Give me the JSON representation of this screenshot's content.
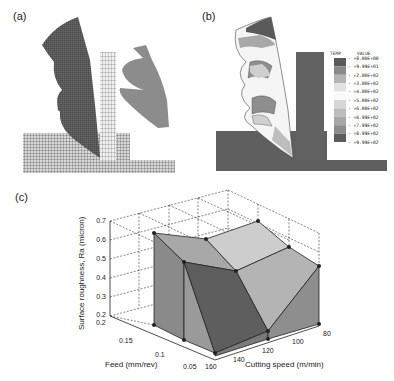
{
  "panels": {
    "a": {
      "label": "(a)"
    },
    "b": {
      "label": "(b)",
      "legend": {
        "header_left": "TEMP",
        "header_right": "VALUE",
        "entries": [
          {
            "value": "+8.00E+00",
            "color": "#5a5a5a"
          },
          {
            "value": "+9.99E+01",
            "color": "#8a8a8a"
          },
          {
            "value": "+2.00E+02",
            "color": "#b4b4b4"
          },
          {
            "value": "+3.00E+02",
            "color": "#e2e2e2"
          },
          {
            "value": "+4.00E+02",
            "color": "#fafafa"
          },
          {
            "value": "+5.00E+02",
            "color": "#d6d6d6"
          },
          {
            "value": "+6.00E+02",
            "color": "#bcbcbc"
          },
          {
            "value": "+6.99E+02",
            "color": "#a6a6a6"
          },
          {
            "value": "+7.99E+02",
            "color": "#8c8c8c"
          },
          {
            "value": "+8.99E+02",
            "color": "#5c5c5c"
          },
          {
            "value": "+9.99E+02",
            "color": "#1e1e1e"
          }
        ]
      }
    },
    "c": {
      "label": "(c)"
    }
  },
  "chart_data": {
    "type": "surface3d",
    "title": "",
    "xlabel": "Cutting speed (m/min)",
    "ylabel": "Feed (mm/rev)",
    "zlabel": "Surface roughness, Ra (micron)",
    "x_ticks": [
      "80",
      "100",
      "120",
      "140",
      "160"
    ],
    "y_ticks": [
      "0.05",
      "0.1",
      "0.15",
      "0.2"
    ],
    "z_ticks": [
      "0.2",
      "0.3",
      "0.4",
      "0.5",
      "0.6",
      "0.7"
    ],
    "x_range": [
      80,
      160
    ],
    "y_range": [
      0.05,
      0.2
    ],
    "zlim": [
      0.2,
      0.7
    ],
    "grid": true,
    "points": [
      {
        "cutting_speed": 160,
        "feed": 0.15,
        "Ra": 0.64
      },
      {
        "cutting_speed": 160,
        "feed": 0.1,
        "Ra": 0.55
      },
      {
        "cutting_speed": 160,
        "feed": 0.05,
        "Ra": 0.26
      },
      {
        "cutting_speed": 120,
        "feed": 0.15,
        "Ra": 0.6
      },
      {
        "cutting_speed": 120,
        "feed": 0.1,
        "Ra": 0.5
      },
      {
        "cutting_speed": 120,
        "feed": 0.05,
        "Ra": 0.27
      },
      {
        "cutting_speed": 80,
        "feed": 0.15,
        "Ra": 0.63
      },
      {
        "cutting_speed": 80,
        "feed": 0.1,
        "Ra": 0.57
      },
      {
        "cutting_speed": 80,
        "feed": 0.05,
        "Ra": 0.51
      }
    ]
  }
}
